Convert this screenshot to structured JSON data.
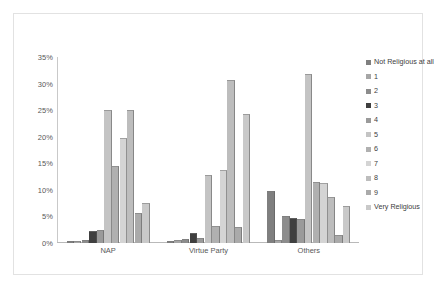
{
  "chart_data": {
    "type": "bar",
    "title": "",
    "xlabel": "",
    "ylabel": "",
    "ylim": [
      0,
      35
    ],
    "grid": false,
    "legend_position": "right",
    "categories": [
      "NAP",
      "Virtue Party",
      "Others"
    ],
    "ytick_labels": [
      "35%",
      "30%",
      "25%",
      "20%",
      "15%",
      "10%",
      "5%",
      "0%"
    ],
    "ytick_values": [
      35,
      30,
      25,
      20,
      15,
      10,
      5,
      0
    ],
    "series": [
      {
        "name": "Not Religious at all",
        "color": "#7f7f7f",
        "values": [
          0.4,
          0.4,
          9.8
        ]
      },
      {
        "name": "1",
        "color": "#a6a6a6",
        "values": [
          0.4,
          0.5,
          0.6
        ]
      },
      {
        "name": "2",
        "color": "#8c8c8c",
        "values": [
          0.6,
          0.8,
          5.0
        ]
      },
      {
        "name": "3",
        "color": "#3f3f3f",
        "values": [
          2.2,
          1.9,
          4.7
        ]
      },
      {
        "name": "4",
        "color": "#9a9a9a",
        "values": [
          2.5,
          1.0,
          4.6
        ]
      },
      {
        "name": "5",
        "color": "#c4c4c4",
        "values": [
          25.0,
          12.8,
          31.8
        ]
      },
      {
        "name": "6",
        "color": "#b0b0b0",
        "values": [
          14.5,
          3.2,
          11.4
        ]
      },
      {
        "name": "7",
        "color": "#d4d4d4",
        "values": [
          19.7,
          13.8,
          11.2
        ]
      },
      {
        "name": "8",
        "color": "#bdbdbd",
        "values": [
          25.0,
          30.6,
          8.6
        ]
      },
      {
        "name": "9",
        "color": "#aaaaaa",
        "values": [
          5.6,
          3.0,
          1.6
        ]
      },
      {
        "name": "Very Religious",
        "color": "#c9c9c9",
        "values": [
          7.5,
          24.3,
          7.0
        ]
      }
    ]
  }
}
